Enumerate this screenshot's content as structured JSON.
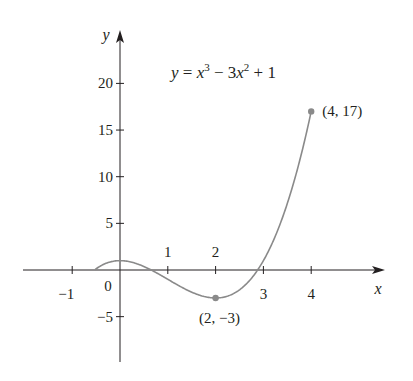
{
  "chart_data": {
    "type": "line",
    "equation": {
      "lhs": "y",
      "eq": "=",
      "t1": "x",
      "e1": "3",
      "minus": "−",
      "t2": "3x",
      "e2": "2",
      "plus": "+",
      "c": "1"
    },
    "xlabel": "x",
    "ylabel": "y",
    "xlim": [
      -2,
      5
    ],
    "ylim": [
      -9,
      24
    ],
    "x_ticks": [
      -1,
      1,
      2,
      3,
      4
    ],
    "x_tick_labels": [
      "−1",
      "1",
      "2",
      "3",
      "4"
    ],
    "y_ticks": [
      -5,
      5,
      10,
      15,
      20
    ],
    "y_tick_labels": [
      "−5",
      "5",
      "10",
      "15",
      "20"
    ],
    "origin_label": "0",
    "domain": [
      -0.52,
      4
    ],
    "function": "x^3 - 3x^2 + 1",
    "points": [
      {
        "x": 2,
        "y": -3,
        "label": "(2, −3)"
      },
      {
        "x": 4,
        "y": 17,
        "label": "(4, 17)"
      }
    ],
    "grid": false,
    "curve_color": "#8a8a8a",
    "axis_color": "#231f20"
  }
}
